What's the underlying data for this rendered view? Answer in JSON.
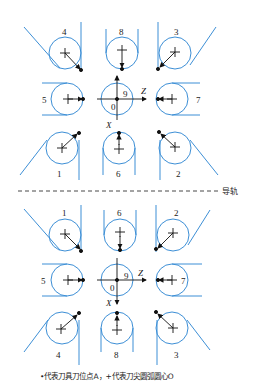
{
  "diagram": {
    "guide_rail_label": "导轨",
    "upper_group": {
      "labels": {
        "top_left": "4",
        "top_center": "8",
        "top_right": "3",
        "mid_left": "5",
        "mid_right": "7",
        "bottom_left": "1",
        "bottom_center": "6",
        "bottom_right": "2",
        "center_quadrant": "9",
        "origin": "0"
      },
      "axis_z": "Z",
      "axis_x": "X"
    },
    "lower_group": {
      "labels": {
        "top_left": "1",
        "top_center": "6",
        "top_right": "2",
        "mid_left": "5",
        "mid_right": "7",
        "bottom_left": "4",
        "bottom_center": "8",
        "bottom_right": "3",
        "center_quadrant": "9",
        "origin": "0"
      },
      "axis_z": "Z",
      "axis_x": "X"
    },
    "caption": "•代表刀具刀位点A，+代表刀尖圆弧圆心O",
    "colors": {
      "tool_outline": "#3d8fd6",
      "marks": "#111111",
      "rail": "#333333"
    }
  }
}
